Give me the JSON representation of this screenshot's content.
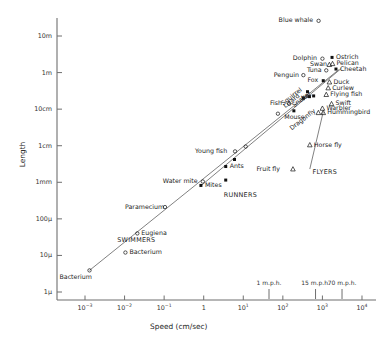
{
  "chart_data": {
    "type": "scatter",
    "title": "",
    "xlabel": "Speed  (cm/sec)",
    "ylabel": "Length",
    "xscale": "log",
    "yscale": "log",
    "xlim": [
      0.0003,
      20000
    ],
    "ylim": [
      0.0001,
      4000
    ],
    "grid": false,
    "legend": "none",
    "xtick_labels": [
      "10-3",
      "10-2",
      "10-1",
      "1",
      "101",
      "102",
      "103",
      "104"
    ],
    "xtick_values": [
      0.001,
      0.01,
      0.1,
      1,
      10,
      100,
      1000,
      10000
    ],
    "ytick_labels": [
      "1μ",
      "10μ",
      "100μ",
      "1mm",
      "1cm",
      "10cm",
      "1m",
      "10m"
    ],
    "ytick_values": [
      0.0001,
      0.001,
      0.01,
      0.1,
      1,
      10,
      100,
      1000
    ],
    "secondary_xaxis": {
      "label": "m.p.h.",
      "ticks": [
        {
          "label": "1 m.p.h.",
          "speed_cm_s": 44.7
        },
        {
          "label": "15 m.p.h.",
          "speed_cm_s": 670
        },
        {
          "label": "70 m.p.h.",
          "speed_cm_s": 3130
        }
      ]
    },
    "group_annotations": [
      {
        "text": "SWIMMERS",
        "speed_cm_s": 0.0065,
        "length_cm": 0.0028
      },
      {
        "text": "RUNNERS",
        "speed_cm_s": 3.2,
        "length_cm": 0.045
      },
      {
        "text": "FLYERS",
        "speed_cm_s": 560,
        "length_cm": 0.2
      }
    ],
    "marker_legend": [
      {
        "marker": "open-circle",
        "meaning": "swimmers"
      },
      {
        "marker": "filled-square",
        "meaning": "runners"
      },
      {
        "marker": "open-triangle",
        "meaning": "flyers"
      }
    ],
    "trend_lines": [
      {
        "name": "swimmers-runners-line",
        "x1": 0.0013,
        "y1": 0.00039,
        "x2": 2600,
        "y2": 120
      },
      {
        "name": "flyers-line",
        "x1": 0.8,
        "y1": 0.076,
        "x2": 3000,
        "y2": 130
      },
      {
        "name": "flyers-callout-line",
        "x1": 480,
        "y1": 0.23,
        "x2": 1050,
        "y2": 8.5
      }
    ],
    "points": [
      {
        "label": "Bacterium",
        "marker": "open-circle",
        "speed_cm_s": 0.0013,
        "length_cm": 0.00039,
        "label_pos": "below-left"
      },
      {
        "label": "Bacterium",
        "marker": "open-circle",
        "speed_cm_s": 0.0105,
        "length_cm": 0.0012,
        "label_pos": "right"
      },
      {
        "label": "Eugiena",
        "marker": "open-circle",
        "speed_cm_s": 0.021,
        "length_cm": 0.004,
        "label_pos": "right"
      },
      {
        "label": "Paramecium",
        "marker": "open-circle",
        "speed_cm_s": 0.105,
        "length_cm": 0.021,
        "label_pos": "left"
      },
      {
        "label": "Water mite",
        "marker": "open-circle",
        "speed_cm_s": 0.95,
        "length_cm": 0.105,
        "label_pos": "left"
      },
      {
        "label": "Mites",
        "marker": "filled-square",
        "speed_cm_s": 0.85,
        "length_cm": 0.082,
        "label_pos": "right"
      },
      {
        "label": "",
        "marker": "filled-square",
        "speed_cm_s": 3.6,
        "length_cm": 0.115,
        "label_pos": "none"
      },
      {
        "label": "Ants",
        "marker": "filled-square",
        "speed_cm_s": 3.6,
        "length_cm": 0.27,
        "label_pos": "right"
      },
      {
        "label": "",
        "marker": "filled-square",
        "speed_cm_s": 6.0,
        "length_cm": 0.42,
        "label_pos": "none"
      },
      {
        "label": "Young fish",
        "marker": "open-circle",
        "speed_cm_s": 6.2,
        "length_cm": 0.7,
        "label_pos": "left"
      },
      {
        "label": "",
        "marker": "open-circle",
        "speed_cm_s": 11.5,
        "length_cm": 0.95,
        "label_pos": "none"
      },
      {
        "label": "",
        "marker": "open-circle",
        "speed_cm_s": 75,
        "length_cm": 7.5,
        "label_pos": "none"
      },
      {
        "label": "Fish",
        "marker": "open-circle",
        "speed_cm_s": 145,
        "length_cm": 14,
        "label_pos": "left"
      },
      {
        "label": "Mouse",
        "marker": "filled-square",
        "speed_cm_s": 190,
        "length_cm": 9.0,
        "label_pos": "below"
      },
      {
        "label": "Lizard",
        "marker": "filled-square",
        "speed_cm_s": 330,
        "length_cm": 20,
        "label_pos": "diagonal"
      },
      {
        "label": "Squirrel",
        "marker": "filled-square",
        "speed_cm_s": 420,
        "length_cm": 30,
        "label_pos": "diagonal"
      },
      {
        "label": "Penguin",
        "marker": "open-circle",
        "speed_cm_s": 330,
        "length_cm": 85,
        "label_pos": "left"
      },
      {
        "label": "Snake",
        "marker": "filled-square",
        "speed_cm_s": 470,
        "length_cm": 22,
        "label_pos": "diagonal"
      },
      {
        "label": "Rat",
        "marker": "filled-square",
        "speed_cm_s": 600,
        "length_cm": 23,
        "label_pos": "diagonal"
      },
      {
        "label": "Dragonfly",
        "marker": "open-triangle",
        "speed_cm_s": 790,
        "length_cm": 8.0,
        "label_pos": "diagonal"
      },
      {
        "label": "Hummingbird",
        "marker": "open-triangle",
        "speed_cm_s": 1050,
        "length_cm": 8.0,
        "label_pos": "right"
      },
      {
        "label": "Warbler",
        "marker": "open-triangle",
        "speed_cm_s": 1000,
        "length_cm": 10.5,
        "label_pos": "right"
      },
      {
        "label": "Swift",
        "marker": "open-triangle",
        "speed_cm_s": 1700,
        "length_cm": 14,
        "label_pos": "right"
      },
      {
        "label": "Flying fish",
        "marker": "open-triangle",
        "speed_cm_s": 1250,
        "length_cm": 25,
        "label_pos": "right"
      },
      {
        "label": "Curlew",
        "marker": "open-triangle",
        "speed_cm_s": 1400,
        "length_cm": 38,
        "label_pos": "right"
      },
      {
        "label": "Duck",
        "marker": "open-triangle",
        "speed_cm_s": 1500,
        "length_cm": 55,
        "label_pos": "right"
      },
      {
        "label": "Fox",
        "marker": "filled-square",
        "speed_cm_s": 1050,
        "length_cm": 60,
        "label_pos": "left"
      },
      {
        "label": "Tuna",
        "marker": "open-circle",
        "speed_cm_s": 1250,
        "length_cm": 115,
        "label_pos": "left"
      },
      {
        "label": "Cheetah",
        "marker": "filled-square",
        "speed_cm_s": 2200,
        "length_cm": 125,
        "label_pos": "right"
      },
      {
        "label": "Swan",
        "marker": "open-triangle",
        "speed_cm_s": 1500,
        "length_cm": 165,
        "label_pos": "left"
      },
      {
        "label": "Pelican",
        "marker": "open-triangle",
        "speed_cm_s": 1800,
        "length_cm": 175,
        "label_pos": "right"
      },
      {
        "label": "Ostrich",
        "marker": "filled-square",
        "speed_cm_s": 1750,
        "length_cm": 260,
        "label_pos": "right"
      },
      {
        "label": "Dolphin",
        "marker": "open-circle",
        "speed_cm_s": 1000,
        "length_cm": 240,
        "label_pos": "left"
      },
      {
        "label": "Horse fly",
        "marker": "open-triangle",
        "speed_cm_s": 480,
        "length_cm": 1.05,
        "label_pos": "right"
      },
      {
        "label": "Fruit fly",
        "marker": "open-triangle",
        "speed_cm_s": 180,
        "length_cm": 0.23,
        "label_pos": "left"
      },
      {
        "label": "Blue whale",
        "marker": "open-circle",
        "speed_cm_s": 800,
        "length_cm": 2600,
        "label_pos": "left"
      }
    ]
  }
}
